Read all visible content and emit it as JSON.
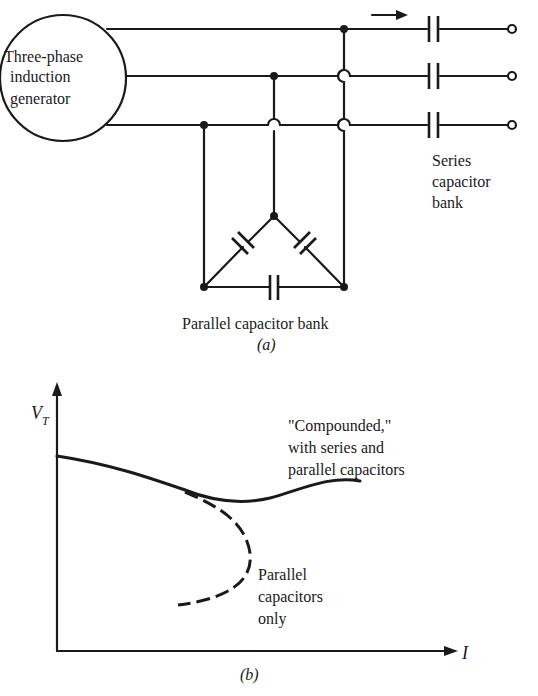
{
  "figure_a": {
    "generator_label_line1": "Three-phase",
    "generator_label_line2": "induction",
    "generator_label_line3": "generator",
    "series_bank_line1": "Series",
    "series_bank_line2": "capacitor",
    "series_bank_line3": "bank",
    "parallel_bank_label": "Parallel capacitor bank",
    "caption": "(a)",
    "terminals": 3,
    "current_arrow": "right-arrow"
  },
  "figure_b": {
    "y_axis_label": "V",
    "y_axis_subscript": "T",
    "x_axis_label": "I",
    "compounded_line1": "\"Compounded,\"",
    "compounded_line2": "with series and",
    "compounded_line3": "parallel capacitors",
    "parallel_only_line1": "Parallel",
    "parallel_only_line2": "capacitors",
    "parallel_only_line3": "only",
    "caption": "(b)"
  },
  "colors": {
    "ink": "#1a1a1a",
    "background": "#ffffff"
  }
}
